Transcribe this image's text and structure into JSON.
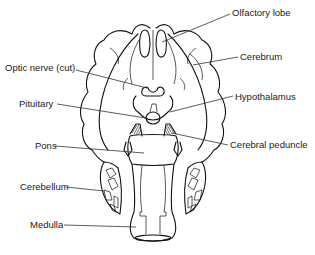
{
  "diagram": {
    "labels": [
      {
        "id": "olfactory-lobe",
        "text": "Olfactory lobe",
        "side": "right"
      },
      {
        "id": "cerebrum",
        "text": "Cerebrum",
        "side": "right"
      },
      {
        "id": "optic-nerve",
        "text": "Optic nerve (cut)",
        "side": "left"
      },
      {
        "id": "hypothalamus",
        "text": "Hypothalamus",
        "side": "right"
      },
      {
        "id": "pituitary",
        "text": "Pituitary",
        "side": "left"
      },
      {
        "id": "pons",
        "text": "Pons",
        "side": "left"
      },
      {
        "id": "cerebral-peduncle",
        "text": "Cerebral peduncle",
        "side": "right"
      },
      {
        "id": "cerebellum",
        "text": "Cerebellum",
        "side": "left"
      },
      {
        "id": "medulla",
        "text": "Medulla",
        "side": "left"
      }
    ],
    "colors": {
      "ink": "#111111",
      "background": "#ffffff",
      "label_text": "#1a1a1a"
    }
  }
}
